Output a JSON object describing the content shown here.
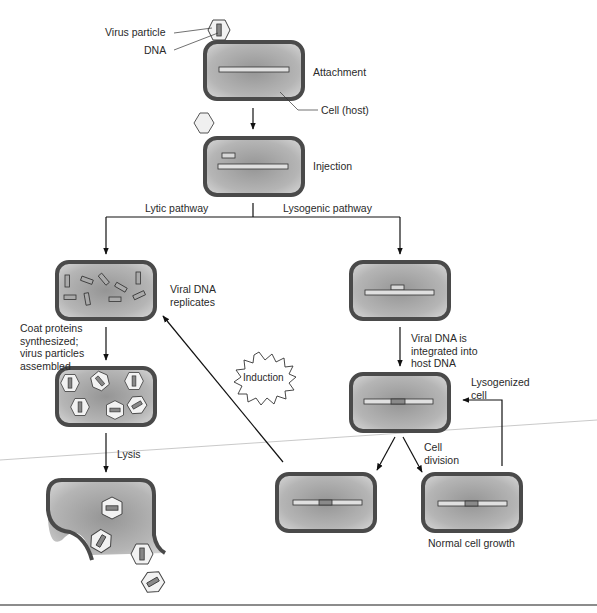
{
  "diagram": {
    "colors": {
      "cell_wall": "#4a4a4a",
      "cell_fill_center": "#9a9a9a",
      "cell_fill_edge": "#d4d4d4",
      "dna_fill": "#e0e0e0",
      "viral_dna_fill": "#8a8a8a",
      "capsid_fill": "#f2f2f2",
      "line": "#111111"
    },
    "labels": {
      "virus_particle": "Virus particle",
      "dna": "DNA",
      "attachment": "Attachment",
      "cell_host": "Cell (host)",
      "injection": "Injection",
      "lytic_pathway": "Lytic pathway",
      "lysogenic_pathway": "Lysogenic pathway",
      "viral_dna_replicates": "Viral DNA replicates",
      "coat_proteins": "Coat proteins synthesized; virus particles assembled",
      "lysis": "Lysis",
      "induction": "Induction",
      "viral_dna_integrated": "Viral DNA is integrated into host DNA",
      "lysogenized_cell": "Lysogenized cell",
      "cell_division": "Cell division",
      "normal_cell_growth": "Normal cell growth"
    },
    "stages": [
      {
        "id": "attachment",
        "label": "Attachment"
      },
      {
        "id": "injection",
        "label": "Injection"
      },
      {
        "id": "replication",
        "pathway": "Lytic",
        "label": "Viral DNA replicates"
      },
      {
        "id": "assembly",
        "pathway": "Lytic",
        "label": "Coat proteins synthesized; virus particles assembled"
      },
      {
        "id": "lysis",
        "pathway": "Lytic",
        "label": "Lysis"
      },
      {
        "id": "integration",
        "pathway": "Lysogenic",
        "label": "Viral DNA is integrated into host DNA"
      },
      {
        "id": "lysogenized",
        "pathway": "Lysogenic",
        "label": "Lysogenized cell"
      },
      {
        "id": "division",
        "pathway": "Lysogenic",
        "label": "Cell division"
      },
      {
        "id": "growth",
        "pathway": "Lysogenic",
        "label": "Normal cell growth"
      }
    ]
  }
}
